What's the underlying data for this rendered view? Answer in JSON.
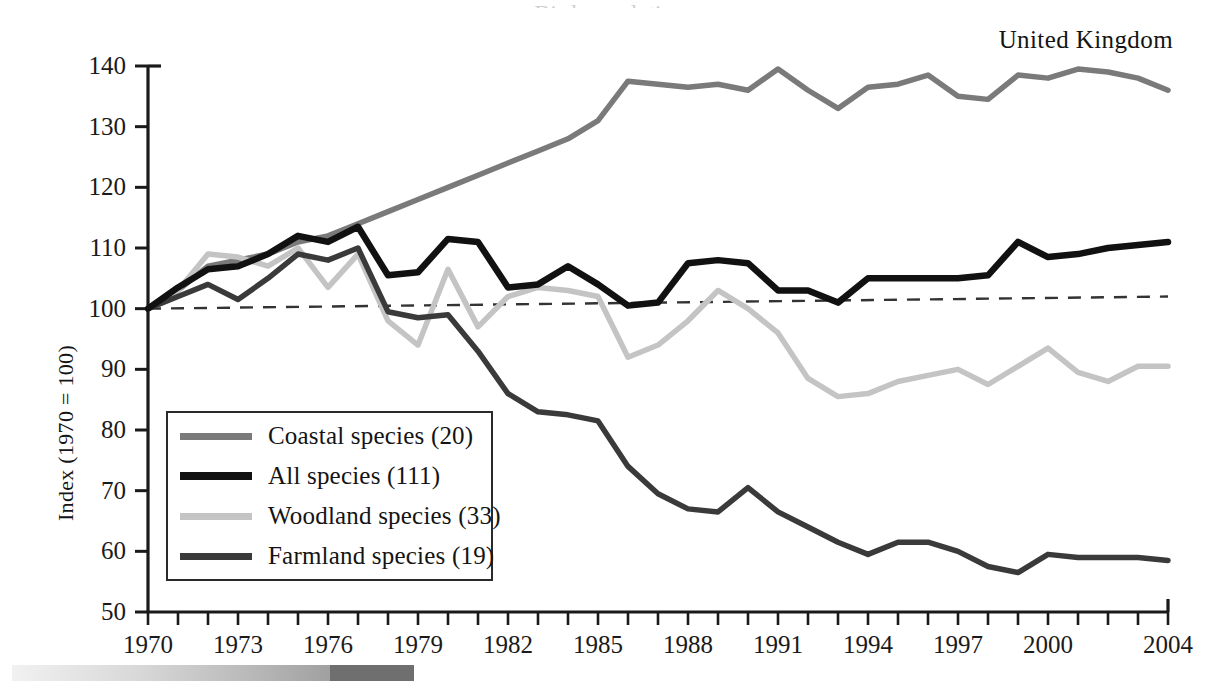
{
  "country_label": "United Kingdom",
  "title_cut_off": "Bird populations",
  "axes": {
    "ylabel": "Index (1970 = 100)",
    "y_ticks": [
      50,
      60,
      70,
      80,
      90,
      100,
      110,
      120,
      130,
      140
    ],
    "ylim": [
      50,
      140
    ],
    "x_ticks": [
      1970,
      1973,
      1976,
      1979,
      1982,
      1985,
      1988,
      1991,
      1994,
      1997,
      2000,
      2004
    ],
    "xlim": [
      1970,
      2004
    ],
    "x_minor_tick_step": 1
  },
  "legend": {
    "position": "inside-bottom-left",
    "entries": [
      {
        "label": "Coastal species (20)",
        "color": "#7a7a7a",
        "width": 7
      },
      {
        "label": "All species (111)",
        "color": "#111111",
        "width": 8
      },
      {
        "label": "Woodland species (33)",
        "color": "#c4c4c4",
        "width": 7
      },
      {
        "label": "Farmland species (19)",
        "color": "#3a3a3a",
        "width": 7
      }
    ]
  },
  "colors": {
    "coastal": "#7a7a7a",
    "all": "#111111",
    "woodland": "#c4c4c4",
    "farmland": "#3a3a3a",
    "axis": "#1a1a1a",
    "reference_dashed": "#333333",
    "background": "#ffffff"
  },
  "chart_data": {
    "type": "line",
    "title": "Bird populations",
    "subtitle": "United Kingdom",
    "xlabel": "",
    "ylabel": "Index (1970 = 100)",
    "xlim": [
      1970,
      2004
    ],
    "ylim": [
      50,
      140
    ],
    "grid": false,
    "legend_position": "inside-bottom-left",
    "x": [
      1970,
      1971,
      1972,
      1973,
      1974,
      1975,
      1976,
      1977,
      1978,
      1979,
      1980,
      1981,
      1982,
      1983,
      1984,
      1985,
      1986,
      1987,
      1988,
      1989,
      1990,
      1991,
      1992,
      1993,
      1994,
      1995,
      1996,
      1997,
      1998,
      1999,
      2000,
      2001,
      2002,
      2003,
      2004
    ],
    "series": [
      {
        "name": "Coastal species (20)",
        "count": 20,
        "color": "#7a7a7a",
        "values": [
          100,
          103,
          107,
          108,
          109,
          111,
          112,
          114,
          116,
          118,
          120,
          122,
          124,
          126,
          128,
          131,
          137.5,
          137,
          136.5,
          137,
          136,
          139.5,
          136,
          133,
          136.5,
          137,
          138.5,
          135,
          134.5,
          138.5,
          138,
          139.5,
          139,
          138,
          136
        ]
      },
      {
        "name": "All species (111)",
        "count": 111,
        "color": "#111111",
        "values": [
          100,
          103.5,
          106.5,
          107,
          109,
          112,
          111,
          113.5,
          105.5,
          106,
          111.5,
          111,
          103.5,
          104,
          107,
          104,
          100.5,
          101,
          107.5,
          108,
          107.5,
          103,
          103,
          101,
          105,
          105,
          105,
          105,
          105.5,
          111,
          108.5,
          109,
          110,
          110.5,
          111
        ]
      },
      {
        "name": "Woodland species (33)",
        "count": 33,
        "color": "#c4c4c4",
        "values": [
          100,
          103,
          109,
          108.5,
          107,
          110,
          103.5,
          109,
          98,
          94,
          106.5,
          97,
          102,
          103.5,
          103,
          102,
          92,
          94,
          98,
          103,
          100,
          96,
          88.5,
          85.5,
          86,
          88,
          89,
          90,
          87.5,
          90.5,
          93.5,
          89.5,
          88,
          90.5,
          90.5
        ]
      },
      {
        "name": "Farmland species (19)",
        "count": 19,
        "color": "#3a3a3a",
        "values": [
          100,
          102,
          104,
          101.5,
          105,
          109,
          108,
          110,
          99.5,
          98.5,
          99,
          93,
          86,
          83,
          82.5,
          81.5,
          74,
          69.5,
          67,
          66.5,
          70.5,
          66.5,
          64,
          61.5,
          59.5,
          61.5,
          61.5,
          60,
          57.5,
          56.5,
          59.5,
          59,
          59,
          59,
          58.5
        ]
      }
    ],
    "annotations": [
      {
        "type": "reference_line",
        "style": "dashed",
        "from": {
          "x": 1970,
          "y": 100
        },
        "to": {
          "x": 2004,
          "y": 102
        },
        "color": "#333333"
      }
    ]
  },
  "bottom_bar": {
    "present": true,
    "description": "grey gradient strip"
  }
}
